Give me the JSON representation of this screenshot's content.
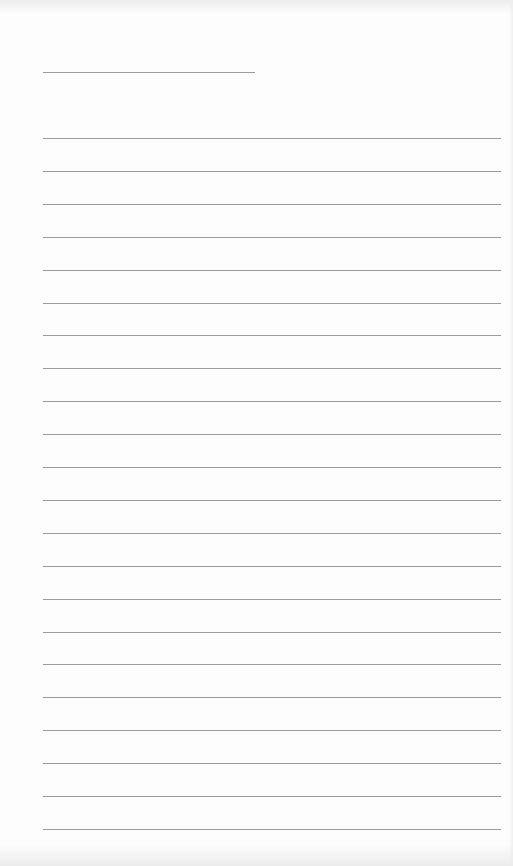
{
  "page": {
    "type": "blank lined paper",
    "background_color": "#fdfdfd",
    "line_color": "#8a8a8a",
    "header_line": {
      "x_start": 43,
      "x_end": 255,
      "y": 72
    },
    "ruled_lines": {
      "count": 22,
      "x_start": 43,
      "x_end": 501,
      "first_y": 138,
      "spacing": 32.9
    }
  }
}
